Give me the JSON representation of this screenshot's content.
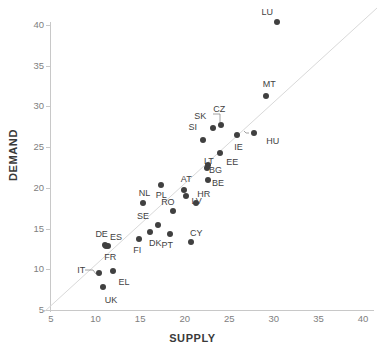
{
  "chart_data": {
    "type": "scatter",
    "title": "",
    "xlabel": "SUPPLY",
    "ylabel": "DEMAND",
    "xlim": [
      5,
      40
    ],
    "ylim": [
      5,
      40
    ],
    "xticks": [
      5,
      10,
      15,
      20,
      25,
      30,
      35,
      40
    ],
    "yticks": [
      5,
      10,
      15,
      20,
      25,
      30,
      35,
      40
    ],
    "grid": false,
    "legend": "none",
    "annotations": [
      "diagonal reference line y = x"
    ],
    "point_color": "#404040",
    "points": [
      {
        "label": "LU",
        "x": 30.4,
        "y": 40.4,
        "label_dx": -16,
        "label_dy": -10
      },
      {
        "label": "MT",
        "x": 29.1,
        "y": 31.3,
        "label_dx": -3,
        "label_dy": -12
      },
      {
        "label": "HU",
        "x": 27.8,
        "y": 26.7,
        "label_dx": 12,
        "label_dy": 8,
        "leader": true
      },
      {
        "label": "IE",
        "x": 25.9,
        "y": 26.5,
        "label_dx": -3,
        "label_dy": 12
      },
      {
        "label": "CZ",
        "x": 24.1,
        "y": 27.7,
        "label_dx": -8,
        "label_dy": -16,
        "leader": true
      },
      {
        "label": "SK",
        "x": 23.2,
        "y": 27.3,
        "label_dx": -19,
        "label_dy": -12
      },
      {
        "label": "SI",
        "x": 22.1,
        "y": 25.9,
        "label_dx": -15,
        "label_dy": -13
      },
      {
        "label": "EE",
        "x": 24.0,
        "y": 24.3,
        "label_dx": 6,
        "label_dy": 9
      },
      {
        "label": "LT",
        "x": 22.6,
        "y": 22.8,
        "label_dx": -4,
        "label_dy": -4
      },
      {
        "label": "BG",
        "x": 22.5,
        "y": 22.4,
        "label_dx": 2,
        "label_dy": 2
      },
      {
        "label": "BE",
        "x": 22.6,
        "y": 21.0,
        "label_dx": 4,
        "label_dy": 3
      },
      {
        "label": "AT",
        "x": 19.9,
        "y": 19.7,
        "label_dx": -3,
        "label_dy": -11
      },
      {
        "label": "LV",
        "x": 20.2,
        "y": 19.0,
        "label_dx": 5,
        "label_dy": 5
      },
      {
        "label": "HR",
        "x": 21.3,
        "y": 18.2,
        "label_dx": 1,
        "label_dy": -9
      },
      {
        "label": "PL",
        "x": 17.3,
        "y": 20.4,
        "label_dx": -5,
        "label_dy": 10
      },
      {
        "label": "NL",
        "x": 15.3,
        "y": 18.1,
        "label_dx": -4,
        "label_dy": -10
      },
      {
        "label": "RO",
        "x": 18.7,
        "y": 17.1,
        "label_dx": -12,
        "label_dy": -9
      },
      {
        "label": "SE",
        "x": 17.0,
        "y": 15.4,
        "label_dx": -21,
        "label_dy": -9
      },
      {
        "label": "DK",
        "x": 16.1,
        "y": 14.6,
        "label_dx": -1,
        "label_dy": 11
      },
      {
        "label": "FI",
        "x": 14.9,
        "y": 13.7,
        "label_dx": -6,
        "label_dy": 11
      },
      {
        "label": "PT",
        "x": 18.4,
        "y": 14.3,
        "label_dx": -9,
        "label_dy": 11
      },
      {
        "label": "CY",
        "x": 20.7,
        "y": 13.3,
        "label_dx": -1,
        "label_dy": -9
      },
      {
        "label": "DE",
        "x": 11.1,
        "y": 13.0,
        "label_dx": -10,
        "label_dy": -11
      },
      {
        "label": "ES",
        "x": 11.4,
        "y": 12.9,
        "label_dx": 2,
        "label_dy": -9
      },
      {
        "label": "FR",
        "x": 11.2,
        "y": 12.8,
        "label_dx": -2,
        "label_dy": 11
      },
      {
        "label": "IT",
        "x": 10.4,
        "y": 9.5,
        "label_dx": -22,
        "label_dy": -3,
        "leader": true
      },
      {
        "label": "EL",
        "x": 11.9,
        "y": 9.8,
        "label_dx": 6,
        "label_dy": 11
      },
      {
        "label": "UK",
        "x": 10.8,
        "y": 7.8,
        "label_dx": 2,
        "label_dy": 13
      }
    ]
  },
  "axes": {
    "x_title": "SUPPLY",
    "y_title": "DEMAND"
  }
}
